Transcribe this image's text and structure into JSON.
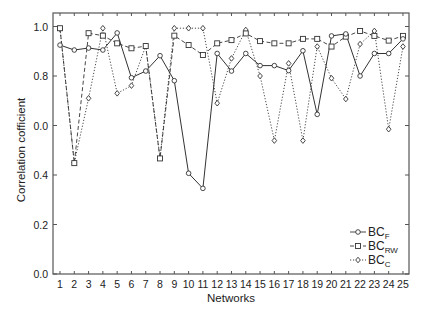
{
  "chart_data": {
    "type": "line",
    "title": "",
    "xlabel": "Networks",
    "ylabel": "Correlation cofficient",
    "x": [
      1,
      2,
      3,
      4,
      5,
      6,
      7,
      8,
      9,
      10,
      11,
      12,
      13,
      14,
      15,
      16,
      17,
      18,
      19,
      20,
      21,
      22,
      23,
      24,
      25
    ],
    "xlim": [
      0.5,
      25.5
    ],
    "ylim": [
      0.0,
      1.05
    ],
    "yticks": [
      0.0,
      0.2,
      0.4,
      0.6,
      0.8,
      1.0
    ],
    "ytick_labels": [
      "0.0",
      "0.2",
      "0.4",
      "0.0",
      "0.8",
      "1.0"
    ],
    "xtick_labels": [
      "1",
      "2",
      "3",
      "4",
      "5",
      "6",
      "7",
      "8",
      "9",
      "10",
      "11",
      "12",
      "13",
      "14",
      "15",
      "16",
      "17",
      "18",
      "19",
      "20",
      "21",
      "22",
      "23",
      "24",
      "25"
    ],
    "grid": false,
    "legend_position": "lower right",
    "series": [
      {
        "name": "BC_F",
        "label_main": "BC",
        "label_sub": "F",
        "marker": "circle",
        "linestyle": "solid",
        "values": [
          0.925,
          0.905,
          0.913,
          0.905,
          0.974,
          0.793,
          0.82,
          0.882,
          0.781,
          0.407,
          0.346,
          0.891,
          0.82,
          0.891,
          0.842,
          0.842,
          0.822,
          0.902,
          0.645,
          0.962,
          0.97,
          0.8,
          0.891,
          0.891,
          0.95
        ]
      },
      {
        "name": "BC_RW",
        "label_main": "BC",
        "label_sub": "RW",
        "marker": "square",
        "linestyle": "dashed",
        "values": [
          0.993,
          0.448,
          0.973,
          0.963,
          0.932,
          0.912,
          0.921,
          0.467,
          0.963,
          0.925,
          0.885,
          0.932,
          0.945,
          0.972,
          0.941,
          0.932,
          0.932,
          0.95,
          0.95,
          0.919,
          0.959,
          0.982,
          0.962,
          0.943,
          0.962
        ]
      },
      {
        "name": "BC_C",
        "label_main": "BC",
        "label_sub": "C",
        "marker": "diamond",
        "linestyle": "dotted",
        "values": [
          0.99,
          0.45,
          0.71,
          0.993,
          0.73,
          0.761,
          0.921,
          0.47,
          0.993,
          0.993,
          0.993,
          0.69,
          0.871,
          0.986,
          0.8,
          0.539,
          0.851,
          0.539,
          0.919,
          0.791,
          0.707,
          0.929,
          0.982,
          0.585,
          0.919
        ]
      }
    ]
  },
  "colors": {
    "line": "#333333",
    "axis": "#555555",
    "background": "#ffffff"
  }
}
